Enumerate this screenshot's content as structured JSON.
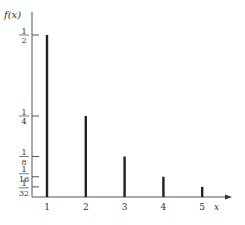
{
  "chart_data": {
    "type": "bar",
    "title": "",
    "xlabel": "x",
    "ylabel": "f(x)",
    "categories": [
      "1",
      "2",
      "3",
      "4",
      "5"
    ],
    "x": [
      1,
      2,
      3,
      4,
      5
    ],
    "values": [
      0.5,
      0.25,
      0.125,
      0.0625,
      0.03125
    ],
    "y_ticks": [
      {
        "value": 0.5,
        "num": "1",
        "den": "2"
      },
      {
        "value": 0.25,
        "num": "1",
        "den": "4"
      },
      {
        "value": 0.125,
        "num": "1",
        "den": "8"
      },
      {
        "value": 0.0625,
        "num": "1",
        "den": "16"
      },
      {
        "value": 0.03125,
        "num": "1",
        "den": "32"
      }
    ],
    "ylim": [
      0,
      0.55
    ],
    "grid": false,
    "legend": null,
    "bar_color": "#222222"
  }
}
